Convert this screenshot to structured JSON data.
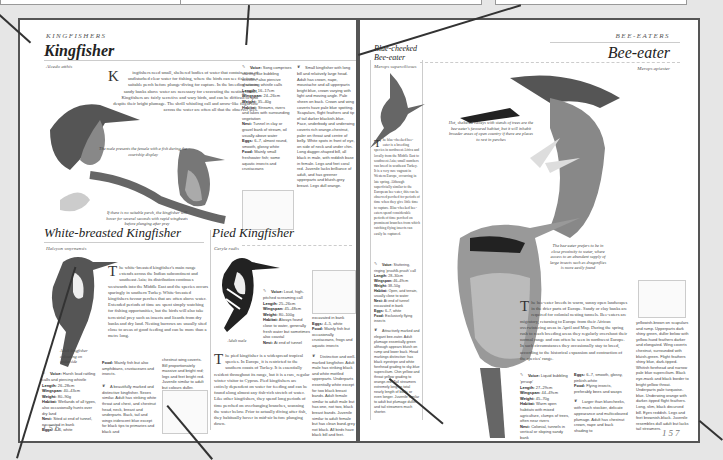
{
  "left_page": {
    "section": "Kingfishers",
    "kingfisher": {
      "title": "Kingfisher",
      "latin": "Alcedo atthis",
      "drop_cap": "K",
      "body": "ingfishers need small, sheltered bodies of water that contain areas of undisturbed clear water for fishing, where the birds can see fish from a suitable perch before plunge-diving for capture. In the breeding season sandy banks above water are necessary for excavating the nesting tunnel. Kingfishers are fairly secretive and wary birds, and can be difficult to spot despite their bright plumage. The shrill whistling call and arrow-like flight low across the water are often all that the observer sees.",
      "caption1": "The male presents the female with a fish during the courtship display",
      "caption2": "If there is no suitable perch, the kingfisher will hover for several seconds with rapid wingbeats before plunging after prey",
      "facts": [
        {
          "label": "Voice:",
          "value": "Song comprises starting-like bubbling whistles; also piercive shuttering whistle calls"
        },
        {
          "label": "Length:",
          "value": "16–17cm"
        },
        {
          "label": "Wingspan:",
          "value": "24–26cm"
        },
        {
          "label": "Weight:",
          "value": "35–40g"
        },
        {
          "label": "Habitat:",
          "value": "Streams, rivers and lakes with surrounding vegetation"
        },
        {
          "label": "Nest:",
          "value": "Tunnel in clay or gravel bank of stream, oil usually above water"
        },
        {
          "label": "Eggs:",
          "value": "6–7, almost round, smooth, glossy white"
        },
        {
          "label": "Food:",
          "value": "Mainly small freshwater fish; some aquatic insects and crustaceans"
        }
      ],
      "plumage": "Small kingfisher with long bill and relatively large head. Adult has crown, nape, moustache and all upperparts bright blue, crown varying with light and moving angle. Pale sheen on back. Crown and wing coverts have pale blue spotting. Scapulars, flight feathers and tip of tail darker blackish-blue. Face, underbody and underwing coverts rich orange-chestnut, paler on throat and centre of belly. White spots in front of eye, on side of neck and under chin. Long dagger-shaped bill, all black in male, with reddish base in female. Legs and feet coral red. Juvenile lacks brilliance of adult, and has greener upperparts and bluish-grey breast. Legs dull orange."
    },
    "white_breasted": {
      "title": "White-breasted Kingfisher",
      "latin": "Halcyon smyrnensis",
      "drop_cap": "T",
      "body": "he white-breasted kingfisher's main range extends across the Indian subcontinent and southeast Asia; its distribution continues westwards into the Middle East and the species occurs sparingly in southern Turkey. White-breasted kingfishers favour perches that are often above water. Extended periods of time are spent simply watching for fishing opportunities, but the birds will also take terrestrial prey such as insects and lizards from dry banks and dry land. Nesting burrows are usually sited close to areas of good feeding and can be more than a metre long.",
      "bird_caption": "Adult kingfisher colouring on underside",
      "facts": [
        {
          "label": "Voice:",
          "value": "Harsh loud rattling calls and piercing whistle"
        },
        {
          "label": "Length:",
          "value": "26–28cm"
        },
        {
          "label": "Wingspan:",
          "value": "40–43cm"
        },
        {
          "label": "Weight:",
          "value": "80–90g"
        },
        {
          "label": "Habitat:",
          "value": "Wetlands of all types, also occasionally hunts over dry land"
        },
        {
          "label": "Nest:",
          "value": "Sited at end of tunnel, excavated in bank"
        },
        {
          "label": "Eggs:",
          "value": "4–6, white"
        }
      ],
      "food": "Mainly fish but also amphibians, crustaceans and insects.",
      "plumage": "A beautifully marked and distinctive kingfisher. Sexes similar. Adult has striking white throat and chest, and chestnut head, neck, breast and underparts. Back, tail and wings iridescent blue except for black tips to primaries and black and",
      "plumage_cont": "chestnut wing coverts. Bill proportionately massive and bright red; legs and feet bright red. Juvenile similar to adult but colours duller."
    },
    "pied": {
      "title": "Pied Kingfisher",
      "latin": "Ceryle rudis",
      "drop_cap": "T",
      "body": "he pied kingfisher is a widespread tropical species. In Europe, it is restricted to the southern coasts of Turkey. It is essentially resident throughout its range, but it is a rare, regular winter visitor to Cyprus. Pied kingfishers are entirely dependent on water for feeding and can be found along almost any fish-rich stretch of water. Like other kingfishers, they spend long periods of time perched on overhanging branches, scanning the water below. Prior to actually diving after fish, they habitually hover in mid-air before plunging down.",
      "bird_caption": "Adult male",
      "facts": [
        {
          "label": "Voice:",
          "value": "Loud, high-pitched screaming call"
        },
        {
          "label": "Length:",
          "value": "25–26cm"
        },
        {
          "label": "Wingspan:",
          "value": "45–48cm"
        },
        {
          "label": "Weight:",
          "value": "80–100g"
        },
        {
          "label": "Habitat:",
          "value": "Always found close to water, generally fresh water but sometimes also coastal"
        },
        {
          "label": "Nest:",
          "value": "At end of tunnel"
        }
      ],
      "facts2": [
        {
          "label": "",
          "value": "excavated in bank"
        },
        {
          "label": "Eggs:",
          "value": "4–5, white"
        },
        {
          "label": "Food:",
          "value": "Mainly fish but occasionally crustaceans, frogs and aquatic insects"
        }
      ],
      "plumage": "Distinctive and well-marked kingfisher. Adult male has striking black and white mottled upperparts. Underparts essentially white except for two black breast bands. Adult female similar to adult male but has one, not two, black breast bands. Juvenile similar to adult female but has clean band-grey not black. All birds have black bill and feet."
    },
    "page_number": "156"
  },
  "right_page": {
    "section": "Bee-eaters",
    "blue_cheeked": {
      "title": "Blue-cheeked Bee-eater",
      "latin": "Merops superciliosus",
      "drop_cap": "T",
      "body": "he blue-cheeked bee-eater is a breeding species in northwest Africa and locally from the Middle East to southwest Asia; small numbers can breed in southeast Turkey. It is a very rare vagrant in Western Europe, occurring in late spring. Although superficially similar to the European bee-eater, this can be observed perched for periods of time when they give little time to capture. Blue-cheeked bee-eaters spend considerable periods of time perched on prominent branches from which catching flying insects can easily be captured.",
      "facts": [
        {
          "label": "Voice:",
          "value": "Stuttering, ringing 'pruuhlk-pruuh' call"
        },
        {
          "label": "Length:",
          "value": "28–30cm"
        },
        {
          "label": "Wingspan:",
          "value": "46–49cm"
        },
        {
          "label": "Weight:",
          "value": "38–50g"
        },
        {
          "label": "Habitat:",
          "value": "Open, arid terrain, usually close to water"
        },
        {
          "label": "Nest:",
          "value": "At end of tunnel excavated in bank"
        },
        {
          "label": "Eggs:",
          "value": "6–7, white"
        },
        {
          "label": "Food:",
          "value": "Exclusively flying insects"
        }
      ],
      "plumage": "Attractively marked and elegant bee-eater. Adult plumage essentially green although appears bluish on rump and lower back. Head markings distinctive: has black eyestripe and white forehead grading to sky-blue supercilium. Chin yellow and throat yellow grading to orange-red. Tail streamers extremely long, in total nearly length of body, or even longer. Juvenile similar to adult but plumage duller and tail streamers much shorter."
    },
    "bee_eater": {
      "title": "Bee-eater",
      "latin": "Merops apiaster",
      "drop_cap": "T",
      "body": "he bee-eater breeds in warm, sunny open landscapes in the drier parts of Europe. Sandy or clay banks are required for colonial nesting tunnels. Bee-eaters are migratory, returning to Europe from their African overwintering areas in April and May. During the spring rush to reach breeding areas they regularly overshoot their normal range and can often be seen in northwest Europe. In such circumstances they occasionally stay to breed, according to the historical expansion and contraction of the species' range.",
      "caption_top": "Hot, sheltered valleys with stands of trees are the bee-eater's favoured habitat, but it will inhabit broader areas of open country if there are places to rest in perches",
      "caption_mid": "The bee-eater prefers to be in close proximity to water, where access to an abundant supply of large insects such as dragonflies is more easily found",
      "facts": [
        {
          "label": "Voice:",
          "value": "Liquid bubbling 'prruup'"
        },
        {
          "label": "Length:",
          "value": "27–29cm"
        },
        {
          "label": "Wingspan:",
          "value": "44–49cm"
        },
        {
          "label": "Weight:",
          "value": "45–70g"
        },
        {
          "label": "Habitat:",
          "value": "Warm open habitats with mixed agriculture, clumps of trees, often near rivers"
        },
        {
          "label": "Nest:",
          "value": "Colonial, tunnels in vertical or sloping sandy bank"
        }
      ],
      "facts2": [
        {
          "label": "Eggs:",
          "value": "6–7, smooth, glossy, pinkish-white"
        },
        {
          "label": "Food:",
          "value": "Flying insects, preferably bees and wasps"
        }
      ],
      "plumage": "Larger than bluecheeks, with much stockier, delicate appearance and multicoloured plumage. Adult has chestnut crown, nape and back shading to",
      "plumage_cont": "yellowish-brown on scapulars and rump. Upperparts dark shiny green, duller below with yellow-hued feathers darker and elongated. Wing coverts chestnut, surrounded with bluish-green. Flight feathers shiny blue, dark-tipped. Whitish forehead and narrow pale blue supercilium. Black eye-mask and black border to bright yellow throat. Underparts pale turquoise-blue. Underwing orange with darker-tipped flight feathers. Long, slim, black decurved bill. Eyes reddish. Legs and feet brownish-black. Juvenile resembles dull adult but lacks tail streamers."
    },
    "page_number": "157"
  },
  "colors": {
    "background": "#e6e6e6",
    "page_border": "#555555",
    "connector": "#333333"
  }
}
